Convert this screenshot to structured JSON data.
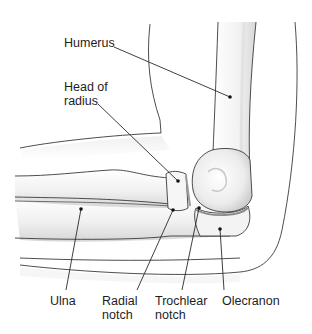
{
  "figure": {
    "labels": [
      {
        "id": "humerus",
        "text": "Humerus",
        "x": 64,
        "y": 43
      },
      {
        "id": "head-of-radius",
        "text": "Head of\nradius",
        "x": 64,
        "y": 80
      },
      {
        "id": "ulna",
        "text": "Ulna",
        "x": 50,
        "y": 293
      },
      {
        "id": "radial-notch",
        "text": "Radial\nnotch",
        "x": 102,
        "y": 293
      },
      {
        "id": "trochlear-notch",
        "text": "Trochlear\nnotch",
        "x": 155,
        "y": 293
      },
      {
        "id": "olecranon",
        "text": "Olecranon",
        "x": 222,
        "y": 293
      }
    ],
    "colors": {
      "outline": "#3a3a3a",
      "bone_fill": "#f4f4f4",
      "bone_shade": "#d9d9d9",
      "skin_shade": "#ececec",
      "leader": "#2a2a2a"
    }
  }
}
